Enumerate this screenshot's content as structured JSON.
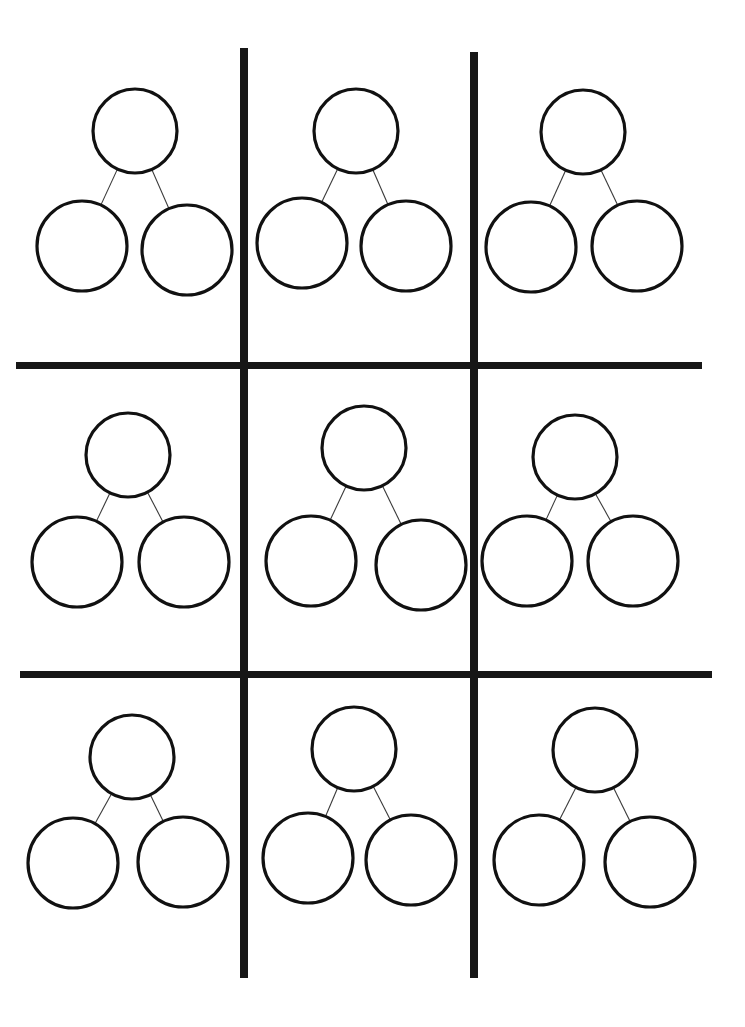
{
  "page": {
    "width": 745,
    "height": 1027,
    "background_color": "#ffffff",
    "ink_color": "#111111",
    "grid_line_color": "#171717",
    "connector_color": "#3a3a3a"
  },
  "grid": {
    "rows": 3,
    "columns": 3,
    "cell_count": 9,
    "vertical_lines": [
      {
        "name": "vertical-divider-1",
        "x": 240,
        "y": 48,
        "width": 8,
        "height": 930
      },
      {
        "name": "vertical-divider-2",
        "x": 470,
        "y": 52,
        "width": 8,
        "height": 926
      }
    ],
    "horizontal_lines": [
      {
        "name": "horizontal-divider-1",
        "x": 16,
        "y": 362,
        "width": 686,
        "height": 7
      },
      {
        "name": "horizontal-divider-2",
        "x": 20,
        "y": 671,
        "width": 692,
        "height": 7
      }
    ]
  },
  "bond_template": {
    "type": "number-bond",
    "parent_circle": {
      "radius": 42,
      "stroke_width": 3.2,
      "fill": "#ffffff"
    },
    "child_circle": {
      "radius": 45,
      "stroke_width": 3.2,
      "fill": "#ffffff"
    },
    "connector": {
      "stroke_width": 1.1,
      "count": 2
    },
    "parent_value": "",
    "left_child_value": "",
    "right_child_value": ""
  },
  "bonds": [
    {
      "id": "bond-r1c1",
      "row": 1,
      "column": 1,
      "parent": {
        "cx": 135,
        "cy": 131,
        "r": 42,
        "value": ""
      },
      "left_child": {
        "cx": 82,
        "cy": 246,
        "r": 45,
        "value": ""
      },
      "right_child": {
        "cx": 187,
        "cy": 250,
        "r": 45,
        "value": ""
      }
    },
    {
      "id": "bond-r1c2",
      "row": 1,
      "column": 2,
      "parent": {
        "cx": 356,
        "cy": 131,
        "r": 42,
        "value": ""
      },
      "left_child": {
        "cx": 302,
        "cy": 243,
        "r": 45,
        "value": ""
      },
      "right_child": {
        "cx": 406,
        "cy": 246,
        "r": 45,
        "value": ""
      }
    },
    {
      "id": "bond-r1c3",
      "row": 1,
      "column": 3,
      "parent": {
        "cx": 583,
        "cy": 132,
        "r": 42,
        "value": ""
      },
      "left_child": {
        "cx": 531,
        "cy": 247,
        "r": 45,
        "value": ""
      },
      "right_child": {
        "cx": 637,
        "cy": 246,
        "r": 45,
        "value": ""
      }
    },
    {
      "id": "bond-r2c1",
      "row": 2,
      "column": 1,
      "parent": {
        "cx": 128,
        "cy": 455,
        "r": 42,
        "value": ""
      },
      "left_child": {
        "cx": 77,
        "cy": 562,
        "r": 45,
        "value": ""
      },
      "right_child": {
        "cx": 184,
        "cy": 562,
        "r": 45,
        "value": ""
      }
    },
    {
      "id": "bond-r2c2",
      "row": 2,
      "column": 2,
      "parent": {
        "cx": 364,
        "cy": 448,
        "r": 42,
        "value": ""
      },
      "left_child": {
        "cx": 311,
        "cy": 561,
        "r": 45,
        "value": ""
      },
      "right_child": {
        "cx": 421,
        "cy": 565,
        "r": 45,
        "value": ""
      }
    },
    {
      "id": "bond-r2c3",
      "row": 2,
      "column": 3,
      "parent": {
        "cx": 575,
        "cy": 457,
        "r": 42,
        "value": ""
      },
      "left_child": {
        "cx": 527,
        "cy": 561,
        "r": 45,
        "value": ""
      },
      "right_child": {
        "cx": 633,
        "cy": 561,
        "r": 45,
        "value": ""
      }
    },
    {
      "id": "bond-r3c1",
      "row": 3,
      "column": 1,
      "parent": {
        "cx": 132,
        "cy": 757,
        "r": 42,
        "value": ""
      },
      "left_child": {
        "cx": 73,
        "cy": 863,
        "r": 45,
        "value": ""
      },
      "right_child": {
        "cx": 183,
        "cy": 862,
        "r": 45,
        "value": ""
      }
    },
    {
      "id": "bond-r3c2",
      "row": 3,
      "column": 2,
      "parent": {
        "cx": 354,
        "cy": 749,
        "r": 42,
        "value": ""
      },
      "left_child": {
        "cx": 308,
        "cy": 858,
        "r": 45,
        "value": ""
      },
      "right_child": {
        "cx": 411,
        "cy": 860,
        "r": 45,
        "value": ""
      }
    },
    {
      "id": "bond-r3c3",
      "row": 3,
      "column": 3,
      "parent": {
        "cx": 595,
        "cy": 750,
        "r": 42,
        "value": ""
      },
      "left_child": {
        "cx": 539,
        "cy": 860,
        "r": 45,
        "value": ""
      },
      "right_child": {
        "cx": 650,
        "cy": 862,
        "r": 45,
        "value": ""
      }
    }
  ]
}
